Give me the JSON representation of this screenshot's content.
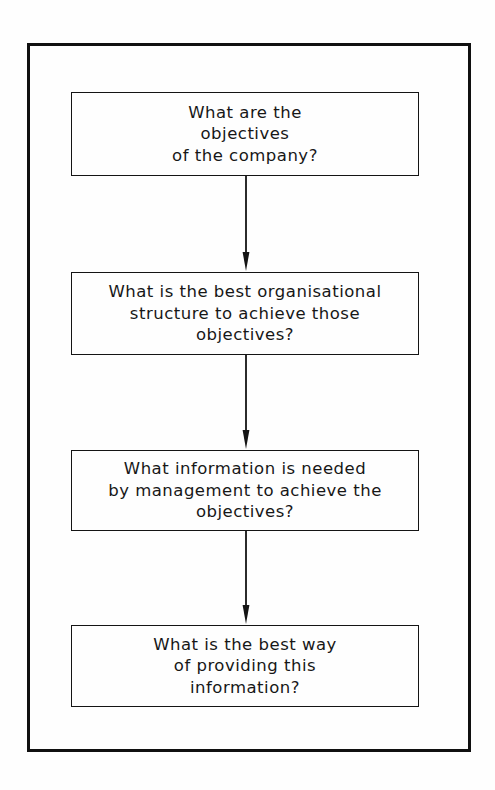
{
  "diagram": {
    "orientation": "vertical-top-down",
    "frame": {
      "style": "thick-rectangular-border",
      "color": "#101010"
    },
    "background_color": "#fefefe",
    "text_color": "#171717",
    "nodes": [
      {
        "id": "node-objectives",
        "order": 1,
        "shape": "rectangle",
        "text": "What are the\nobjectives\nof the company?",
        "lines": [
          "What are the",
          "objectives",
          "of the company?"
        ]
      },
      {
        "id": "node-structure",
        "order": 2,
        "shape": "rectangle",
        "text": "What is the best organisational\nstructure to achieve those\nobjectives?",
        "lines": [
          "What is the best organisational",
          "structure to achieve those",
          "objectives?"
        ]
      },
      {
        "id": "node-information",
        "order": 3,
        "shape": "rectangle",
        "text": "What information is needed\nby management to achieve the\nobjectives?",
        "lines": [
          "What information is needed",
          "by management to achieve the",
          "objectives?"
        ]
      },
      {
        "id": "node-delivery",
        "order": 4,
        "shape": "rectangle",
        "text": "What is the best way\nof providing this\ninformation?",
        "lines": [
          "What is the best way",
          "of providing this",
          "information?"
        ]
      }
    ],
    "connectors": [
      {
        "id": "connector-1",
        "from": "node-objectives",
        "to": "node-structure",
        "style": "solid-line-arrow",
        "direction": "down"
      },
      {
        "id": "connector-2",
        "from": "node-structure",
        "to": "node-information",
        "style": "solid-line-arrow",
        "direction": "down"
      },
      {
        "id": "connector-3",
        "from": "node-information",
        "to": "node-delivery",
        "style": "solid-line-arrow",
        "direction": "down"
      }
    ]
  }
}
